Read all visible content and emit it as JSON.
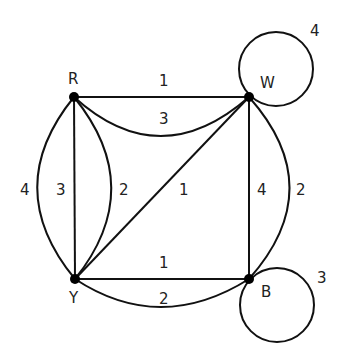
{
  "graph": {
    "nodes": [
      {
        "id": "R",
        "label": "R"
      },
      {
        "id": "W",
        "label": "W"
      },
      {
        "id": "Y",
        "label": "Y"
      },
      {
        "id": "B",
        "label": "B"
      }
    ],
    "edges": [
      {
        "from": "R",
        "to": "W",
        "weight": "1",
        "shape": "straight"
      },
      {
        "from": "R",
        "to": "W",
        "weight": "3",
        "shape": "curve"
      },
      {
        "from": "R",
        "to": "Y",
        "weight": "4",
        "shape": "outer-arc"
      },
      {
        "from": "R",
        "to": "Y",
        "weight": "3",
        "shape": "straight"
      },
      {
        "from": "R",
        "to": "Y",
        "weight": "2",
        "shape": "inner-arc"
      },
      {
        "from": "Y",
        "to": "W",
        "weight": "1",
        "shape": "diagonal"
      },
      {
        "from": "W",
        "to": "B",
        "weight": "4",
        "shape": "straight"
      },
      {
        "from": "W",
        "to": "B",
        "weight": "2",
        "shape": "arc"
      },
      {
        "from": "Y",
        "to": "B",
        "weight": "1",
        "shape": "straight"
      },
      {
        "from": "Y",
        "to": "B",
        "weight": "2",
        "shape": "curve"
      },
      {
        "from": "W",
        "to": "W",
        "weight": "4",
        "shape": "loop"
      },
      {
        "from": "B",
        "to": "B",
        "weight": "3",
        "shape": "loop"
      }
    ]
  }
}
